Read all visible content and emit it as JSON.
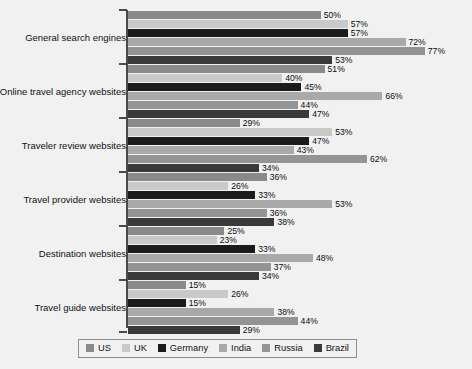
{
  "chart_data": {
    "type": "bar",
    "orientation": "horizontal",
    "title": "",
    "subtitle": "",
    "xlabel": "",
    "ylabel": "",
    "xlim": [
      0,
      80
    ],
    "grid": false,
    "legend_position": "bottom",
    "value_suffix": "%",
    "categories": [
      "General search engines",
      "Online travel agency websites",
      "Traveler review websites",
      "Travel provider websites",
      "Destination websites",
      "Travel guide websites"
    ],
    "series": [
      {
        "name": "US",
        "color": "#8a8a8a",
        "values": [
          50,
          51,
          29,
          36,
          25,
          15
        ]
      },
      {
        "name": "UK",
        "color": "#c9c9c9",
        "values": [
          57,
          40,
          53,
          26,
          23,
          26
        ]
      },
      {
        "name": "Germany",
        "color": "#1b1b1b",
        "values": [
          57,
          45,
          47,
          33,
          33,
          15
        ]
      },
      {
        "name": "India",
        "color": "#a9a9a9",
        "values": [
          72,
          66,
          43,
          53,
          48,
          38
        ]
      },
      {
        "name": "Russia",
        "color": "#949494",
        "values": [
          77,
          44,
          62,
          36,
          37,
          44
        ]
      },
      {
        "name": "Brazil",
        "color": "#3a3a3a",
        "values": [
          53,
          47,
          34,
          38,
          34,
          29
        ]
      }
    ],
    "labels": [
      [
        "50%",
        "57%",
        "57%",
        "72%",
        "77%",
        "53%"
      ],
      [
        "51%",
        "40%",
        "45%",
        "66%",
        "44%",
        "47%"
      ],
      [
        "29%",
        "53%",
        "47%",
        "43%",
        "62%",
        "34%"
      ],
      [
        "36%",
        "26%",
        "33%",
        "53%",
        "36%",
        "38%"
      ],
      [
        "25%",
        "23%",
        "33%",
        "48%",
        "37%",
        "34%"
      ],
      [
        "15%",
        "26%",
        "15%",
        "38%",
        "44%",
        "29%"
      ]
    ]
  },
  "legend": {
    "items": [
      {
        "label": "US",
        "color": "#8a8a8a"
      },
      {
        "label": "UK",
        "color": "#c9c9c9"
      },
      {
        "label": "Germany",
        "color": "#1b1b1b"
      },
      {
        "label": "India",
        "color": "#a9a9a9"
      },
      {
        "label": "Russia",
        "color": "#949494"
      },
      {
        "label": "Brazil",
        "color": "#3a3a3a"
      }
    ]
  },
  "style": {
    "background": "#f1f1f1",
    "plot_background": "#ffffff",
    "axis_color": "#4a4a4a",
    "text_color": "#111111"
  }
}
